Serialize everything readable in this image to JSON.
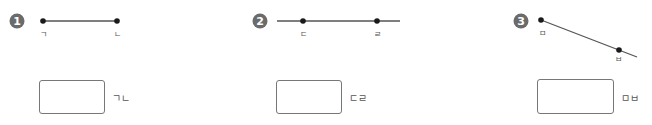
{
  "figures": [
    {
      "number": "1",
      "type": "line-segment",
      "points": [
        {
          "label": "ㄱ"
        },
        {
          "label": "ㄴ"
        }
      ],
      "answer_box": {
        "value": "",
        "label": "ㄱㄴ"
      }
    },
    {
      "number": "2",
      "type": "line",
      "points": [
        {
          "label": "ㄷ"
        },
        {
          "label": "ㄹ"
        }
      ],
      "answer_box": {
        "value": "",
        "label": "ㄷㄹ"
      }
    },
    {
      "number": "3",
      "type": "ray",
      "points": [
        {
          "label": "ㅁ"
        },
        {
          "label": "ㅂ"
        }
      ],
      "answer_box": {
        "value": "",
        "label": "ㅁㅂ"
      }
    }
  ],
  "colors": {
    "badge": "#6b6b6b",
    "line": "#555555",
    "point": "#1a1a1a",
    "box_border": "#777777"
  }
}
